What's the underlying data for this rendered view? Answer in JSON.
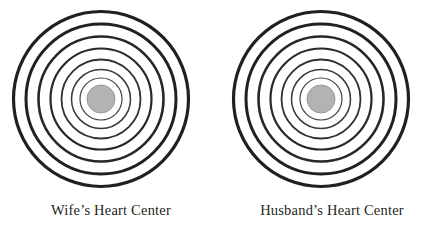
{
  "page": {
    "width": 443,
    "height": 229,
    "background": "#ffffff"
  },
  "diagrams": [
    {
      "id": "wife-heart-center",
      "caption": "Wife’s Heart Center",
      "center": {
        "x": 101,
        "y": 99
      },
      "core": {
        "radius": 14,
        "fill": "#b3b3b3",
        "stroke": "#8c8c8c",
        "stroke_width": 0.8
      },
      "rings": [
        {
          "index": 1,
          "radius": 87.5,
          "stroke": "#231f20",
          "stroke_width": 3.2
        },
        {
          "index": 2,
          "radius": 75.0,
          "stroke": "#231f20",
          "stroke_width": 3.0
        },
        {
          "index": 3,
          "radius": 62.5,
          "stroke": "#2b2728",
          "stroke_width": 2.6
        },
        {
          "index": 4,
          "radius": 50.5,
          "stroke": "#2b2728",
          "stroke_width": 2.2
        },
        {
          "index": 5,
          "radius": 39.5,
          "stroke": "#333031",
          "stroke_width": 1.8
        },
        {
          "index": 6,
          "radius": 29.5,
          "stroke": "#3b3839",
          "stroke_width": 1.5
        },
        {
          "index": 7,
          "radius": 21.0,
          "stroke": "#444141",
          "stroke_width": 1.2
        }
      ]
    },
    {
      "id": "husband-heart-center",
      "caption": "Husband’s Heart Center",
      "center": {
        "x": 100,
        "y": 99
      },
      "core": {
        "radius": 14,
        "fill": "#b3b3b3",
        "stroke": "#8c8c8c",
        "stroke_width": 0.8
      },
      "rings": [
        {
          "index": 1,
          "radius": 87.5,
          "stroke": "#231f20",
          "stroke_width": 3.2
        },
        {
          "index": 2,
          "radius": 75.0,
          "stroke": "#231f20",
          "stroke_width": 3.0
        },
        {
          "index": 3,
          "radius": 62.5,
          "stroke": "#2b2728",
          "stroke_width": 2.6
        },
        {
          "index": 4,
          "radius": 50.5,
          "stroke": "#2b2728",
          "stroke_width": 2.2
        },
        {
          "index": 5,
          "radius": 39.5,
          "stroke": "#333031",
          "stroke_width": 1.8
        },
        {
          "index": 6,
          "radius": 29.5,
          "stroke": "#3b3839",
          "stroke_width": 1.5
        },
        {
          "index": 7,
          "radius": 21.0,
          "stroke": "#444141",
          "stroke_width": 1.2
        }
      ]
    }
  ],
  "chart_data": {
    "type": "diagram",
    "title": "",
    "subtitle": "",
    "items": [
      {
        "label": "Wife’s Heart Center",
        "ring_count": 7,
        "has_filled_core": true,
        "core_fill": "#b3b3b3"
      },
      {
        "label": "Husband’s Heart Center",
        "ring_count": 7,
        "has_filled_core": true,
        "core_fill": "#b3b3b3"
      }
    ],
    "legend": [],
    "xlabel": "",
    "ylabel": ""
  }
}
